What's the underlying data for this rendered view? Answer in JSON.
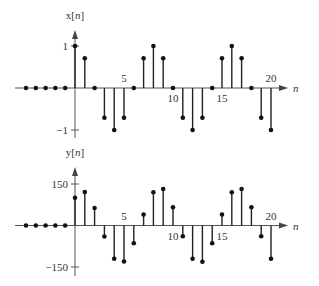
{
  "chart_data": [
    {
      "type": "stem",
      "title": "",
      "ylabel": "x[n]",
      "xlabel": "n",
      "xlim": [
        -5,
        20
      ],
      "ylim": [
        -1,
        1
      ],
      "yticks": [
        {
          "value": 1,
          "label": "1"
        },
        {
          "value": -1,
          "label": "−1"
        }
      ],
      "xticks": [
        {
          "value": 5,
          "label": "5"
        },
        {
          "value": 10,
          "label": "10"
        },
        {
          "value": 15,
          "label": "15"
        },
        {
          "value": 20,
          "label": "20"
        }
      ],
      "grid": false,
      "n": [
        -5,
        -4,
        -3,
        -2,
        -1,
        0,
        1,
        2,
        3,
        4,
        5,
        6,
        7,
        8,
        9,
        10,
        11,
        12,
        13,
        14,
        15,
        16,
        17,
        18,
        19,
        20
      ],
      "values": [
        0,
        0,
        0,
        0,
        0,
        1,
        0.707,
        0,
        -0.707,
        -1,
        -0.707,
        0,
        0.707,
        1,
        0.707,
        0,
        -0.707,
        -1,
        -0.707,
        0,
        0.707,
        1,
        0.707,
        0,
        -0.707,
        -1
      ]
    },
    {
      "type": "stem",
      "title": "",
      "ylabel": "y[n]",
      "xlabel": "n",
      "xlim": [
        -5,
        20
      ],
      "ylim": [
        -150,
        150
      ],
      "yticks": [
        {
          "value": 150,
          "label": "150"
        },
        {
          "value": -150,
          "label": "−150"
        }
      ],
      "xticks": [
        {
          "value": 5,
          "label": "5"
        },
        {
          "value": 10,
          "label": "10"
        },
        {
          "value": 15,
          "label": "15"
        },
        {
          "value": 20,
          "label": "20"
        }
      ],
      "grid": false,
      "n": [
        -5,
        -4,
        -3,
        -2,
        -1,
        0,
        1,
        2,
        3,
        4,
        5,
        6,
        7,
        8,
        9,
        10,
        11,
        12,
        13,
        14,
        15,
        16,
        17,
        18,
        19,
        20
      ],
      "values": [
        0,
        0,
        0,
        0,
        0,
        100,
        121,
        63,
        -40,
        -120,
        -130,
        -64,
        40,
        120,
        132,
        66,
        -39,
        -120,
        -131,
        -64,
        40,
        120,
        132,
        66,
        -39,
        -120
      ]
    }
  ],
  "plots": [
    {
      "ylabel_main": "x[",
      "ylabel_var": "n",
      "ylabel_end": "]",
      "xlabel": "n",
      "origin_x": 75,
      "axis_y": 88,
      "dx": 9.8,
      "unit_px": 42,
      "scale": 1,
      "x_start": 15,
      "x_end": 288,
      "y_top": 30,
      "y_bottom": 138,
      "label_y": 19
    },
    {
      "ylabel_main": "y[",
      "ylabel_var": "n",
      "ylabel_end": "]",
      "xlabel": "n",
      "origin_x": 75,
      "axis_y": 225.5,
      "dx": 9.8,
      "unit_px": 41.5,
      "scale": 150,
      "x_start": 15,
      "x_end": 288,
      "y_top": 167,
      "y_bottom": 276,
      "label_y": 156
    }
  ]
}
